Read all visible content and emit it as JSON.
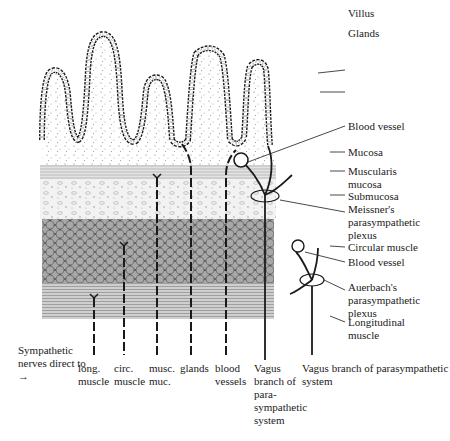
{
  "diagram": {
    "right_labels": [
      {
        "id": "villus",
        "text": "Villus"
      },
      {
        "id": "glands",
        "text": "Glands"
      },
      {
        "id": "blood-vessel-1",
        "text": "Blood vessel"
      },
      {
        "id": "mucosa",
        "text": "Mucosa"
      },
      {
        "id": "muscularis-mucosa",
        "text": "Muscularis mucosa"
      },
      {
        "id": "submucosa",
        "text": "Submucosa"
      },
      {
        "id": "meissners-plexus",
        "text": "Meissner's parasympathetic plexus"
      },
      {
        "id": "circular-muscle",
        "text": "Circular muscle"
      },
      {
        "id": "blood-vessel-2",
        "text": "Blood vessel"
      },
      {
        "id": "auerbachs-plexus",
        "text": "Auerbach's parasympathetic plexus"
      },
      {
        "id": "longitudinal-muscle",
        "text": "Longitudinal muscle"
      }
    ],
    "bottom_labels": {
      "sympathetic_intro": "Sympathetic nerves direct to →",
      "targets": [
        {
          "id": "long-muscle",
          "text": "long. muscle"
        },
        {
          "id": "circ-muscle",
          "text": "circ. muscle"
        },
        {
          "id": "musc-muc",
          "text": "musc. muc."
        },
        {
          "id": "glands",
          "text": "glands"
        },
        {
          "id": "blood-vessels",
          "text": "blood vessels"
        }
      ],
      "vagus_1": "Vagus branch of para- sympathetic system",
      "vagus_2": "Vagus branch of parasympathetic system"
    },
    "colors": {
      "ink": "#1a1a1a",
      "stipple": "#9a9a9a",
      "muscle_cells": "#8c8c8c",
      "background": "#ffffff"
    }
  }
}
